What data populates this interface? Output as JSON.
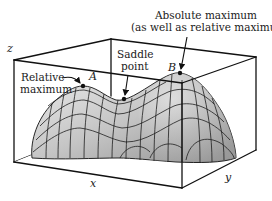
{
  "figure": {
    "type": "3D surface plot with labeled extrema",
    "axes": {
      "x": "x",
      "y": "y",
      "z": "z"
    },
    "annotations": {
      "relative_max": {
        "line1": "Relative",
        "line2": "maximum",
        "point": "A"
      },
      "saddle": {
        "line1": "Saddle",
        "line2": "point"
      },
      "absolute_max": {
        "line1": "Absolute maximum",
        "line2": "(as well as relative maximum)",
        "point": "B"
      }
    },
    "colors": {
      "surface_light": "#e6e6e6",
      "surface_dark": "#9a9a9a",
      "lines": "#111111",
      "background": "#ffffff"
    }
  }
}
